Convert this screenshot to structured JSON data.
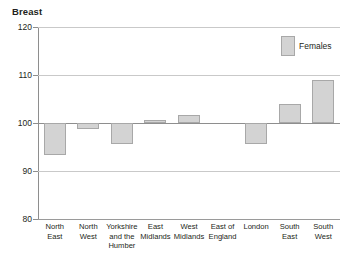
{
  "chart_data": {
    "type": "bar",
    "title": "Breast",
    "xlabel": "",
    "ylabel": "",
    "ylim": [
      80,
      120
    ],
    "yticks": [
      80,
      90,
      100,
      110,
      120
    ],
    "grid": true,
    "baseline": 100,
    "legend_position": "top-right",
    "bar_color": "#d3d3d3",
    "bar_border_color": "#a8a8a8",
    "categories": [
      "North East",
      "North West",
      "Yorkshire and the Humber",
      "East Midlands",
      "West Midlands",
      "East of England",
      "London",
      "South East",
      "South West"
    ],
    "category_lines": [
      [
        "North",
        "East"
      ],
      [
        "North",
        "West"
      ],
      [
        "Yorkshire",
        "and the",
        "Humber"
      ],
      [
        "East",
        "Midlands"
      ],
      [
        "West",
        "Midlands"
      ],
      [
        "East of",
        "England"
      ],
      [
        "London"
      ],
      [
        "South",
        "East"
      ],
      [
        "South",
        "West"
      ]
    ],
    "series": [
      {
        "name": "Females",
        "values": [
          93.4,
          98.8,
          95.6,
          100.6,
          101.7,
          100.0,
          95.7,
          104.0,
          108.9
        ]
      }
    ]
  },
  "legend": {
    "entries": [
      {
        "label": "Females",
        "color": "#d3d3d3"
      }
    ]
  }
}
